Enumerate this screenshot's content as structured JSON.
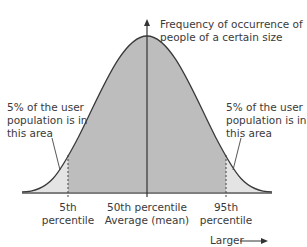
{
  "y_axis": {
    "label_line1": "Frequency of occurrence of",
    "label_line2": "people of a certain size"
  },
  "left_annotation": {
    "line1": "5% of the user",
    "line2": "population is in",
    "line3": "this area"
  },
  "right_annotation": {
    "line1": "5% of the user",
    "line2": "population is in",
    "line3": "this area"
  },
  "ticks": {
    "p5": {
      "line1": "5th",
      "line2": "percentile"
    },
    "p50": {
      "line1": "50th percentile",
      "line2": "Average (mean)"
    },
    "p95": {
      "line1": "95th",
      "line2": "percentile"
    }
  },
  "x_direction_label": "Larger",
  "colors": {
    "center_fill": "#bdbdbd",
    "tail_fill": "#e4e4e4",
    "curve": "#3a3a3a",
    "axis": "#555555"
  }
}
